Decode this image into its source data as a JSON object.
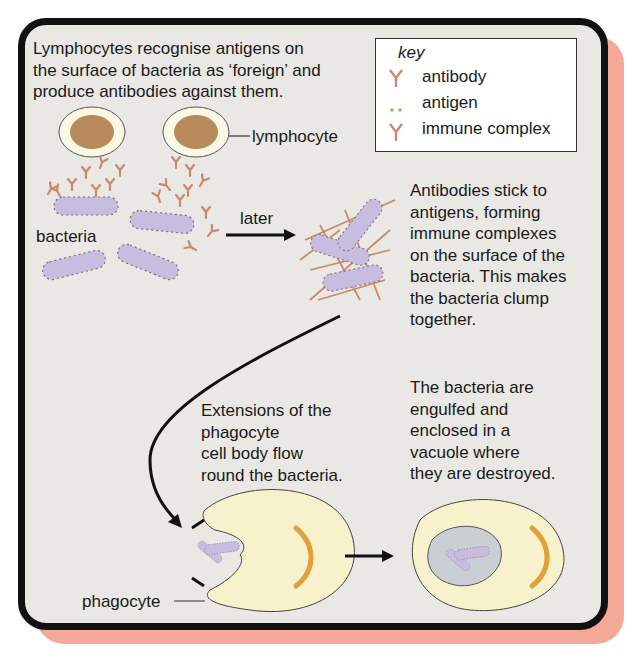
{
  "intro": {
    "text": "Lymphocytes recognise antigens on\nthe surface of bacteria as ‘foreign’ and\nproduce antibodies against them."
  },
  "key": {
    "title": "key",
    "items": [
      {
        "icon": "antibody-icon",
        "label": "antibody"
      },
      {
        "icon": "antigen-icon",
        "label": "antigen"
      },
      {
        "icon": "immune-complex-icon",
        "label": "immune complex"
      }
    ]
  },
  "labels": {
    "lymphocyte": "lymphocyte",
    "bacteria": "bacteria",
    "later": "later",
    "phagocyte": "phagocyte"
  },
  "captions": {
    "clump": "Antibodies stick to\nantigens, forming\nimmune complexes\non the surface of the\nbacteria. This makes\nthe bacteria clump\ntogether.",
    "extensions": "Extensions of the\nphagocyte\ncell body flow\nround the bacteria.",
    "engulfed": "The bacteria are\nengulfed and\nenclosed in a\nvacuole where\nthey are destroyed."
  },
  "colors": {
    "panel_bg": "#e9e8e4",
    "border": "#111111",
    "shadow": "#f4a898",
    "bacteria": "#c7bde0",
    "antibody": "#c98a6a",
    "cell_nucleus": "#b8895a",
    "phagocyte": "#f7f2cc",
    "vacuole": "#c9cfd3"
  }
}
